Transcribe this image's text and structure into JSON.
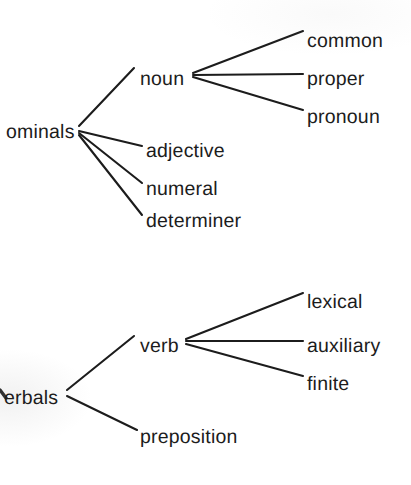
{
  "figure": {
    "kind": "linguistic-tree-diagram",
    "background_color": "#ffffff",
    "ink_color": "#1c1c1c",
    "width": 411,
    "height": 485,
    "trees": [
      {
        "id": "nominals-tree",
        "root": {
          "label": "ominals",
          "x": 6,
          "y": 133,
          "truncated": true
        },
        "branches": [
          {
            "label": "noun",
            "x": 140,
            "y": 80,
            "has_children": true
          },
          {
            "label": "adjective",
            "x": 146,
            "y": 152,
            "has_children": false
          },
          {
            "label": "numeral",
            "x": 146,
            "y": 190,
            "has_children": false
          },
          {
            "label": "determiner",
            "x": 146,
            "y": 222,
            "has_children": false
          }
        ],
        "leaves_of_noun": [
          {
            "label": "common",
            "x": 307,
            "y": 42
          },
          {
            "label": "proper",
            "x": 307,
            "y": 80
          },
          {
            "label": "pronoun",
            "x": 307,
            "y": 118
          }
        ]
      },
      {
        "id": "verbals-tree",
        "root": {
          "label": "erbals",
          "x": 4,
          "y": 399,
          "truncated": true
        },
        "branches": [
          {
            "label": "verb",
            "x": 140,
            "y": 347,
            "has_children": true
          },
          {
            "label": "preposition",
            "x": 140,
            "y": 438,
            "has_children": false
          }
        ],
        "leaves_of_verb": [
          {
            "label": "lexical",
            "x": 307,
            "y": 303
          },
          {
            "label": "auxiliary",
            "x": 307,
            "y": 347
          },
          {
            "label": "finite",
            "x": 307,
            "y": 385
          }
        ]
      }
    ],
    "edges": [
      {
        "name": "ominals-to-noun",
        "x1": 79,
        "y1": 126,
        "x2": 134,
        "y2": 68
      },
      {
        "name": "ominals-to-adjective",
        "x1": 79,
        "y1": 131,
        "x2": 142,
        "y2": 146
      },
      {
        "name": "ominals-to-numeral",
        "x1": 79,
        "y1": 133,
        "x2": 142,
        "y2": 183
      },
      {
        "name": "ominals-to-determiner",
        "x1": 79,
        "y1": 135,
        "x2": 142,
        "y2": 215
      },
      {
        "name": "noun-to-common",
        "x1": 193,
        "y1": 73,
        "x2": 303,
        "y2": 31
      },
      {
        "name": "noun-to-proper",
        "x1": 193,
        "y1": 75,
        "x2": 303,
        "y2": 74
      },
      {
        "name": "noun-to-pronoun",
        "x1": 193,
        "y1": 77,
        "x2": 303,
        "y2": 110
      },
      {
        "name": "verbals-to-verb",
        "x1": 67,
        "y1": 390,
        "x2": 134,
        "y2": 336
      },
      {
        "name": "verbals-to-preposition",
        "x1": 67,
        "y1": 396,
        "x2": 137,
        "y2": 430
      },
      {
        "name": "verb-to-lexical",
        "x1": 186,
        "y1": 339,
        "x2": 303,
        "y2": 293
      },
      {
        "name": "verb-to-auxiliary",
        "x1": 186,
        "y1": 341,
        "x2": 303,
        "y2": 341
      },
      {
        "name": "verb-to-finite",
        "x1": 186,
        "y1": 344,
        "x2": 303,
        "y2": 376
      }
    ],
    "truncated_marks": [
      {
        "name": "verbals-v-stem",
        "x1": 0,
        "y1": 390,
        "x2": 6,
        "y2": 398
      }
    ]
  }
}
